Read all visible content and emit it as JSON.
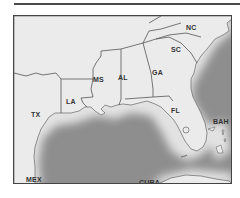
{
  "map": {
    "region": "Southeastern United States and Gulf of Mexico",
    "labels": [
      {
        "id": "nc",
        "text": "NC",
        "x": 185,
        "y": 23
      },
      {
        "id": "sc",
        "text": "SC",
        "x": 170,
        "y": 45
      },
      {
        "id": "ga",
        "text": "GA",
        "x": 151,
        "y": 68
      },
      {
        "id": "al",
        "text": "AL",
        "x": 117,
        "y": 73
      },
      {
        "id": "ms",
        "text": "MS",
        "x": 92,
        "y": 75
      },
      {
        "id": "la",
        "text": "LA",
        "x": 65,
        "y": 97
      },
      {
        "id": "tx",
        "text": "TX",
        "x": 30,
        "y": 110
      },
      {
        "id": "fl",
        "text": "FL",
        "x": 170,
        "y": 106
      },
      {
        "id": "bah",
        "text": "BAH",
        "x": 212,
        "y": 117
      },
      {
        "id": "mex",
        "text": "MEX",
        "x": 25,
        "y": 175
      },
      {
        "id": "cuba",
        "text": "CUBA",
        "x": 138,
        "y": 178
      }
    ],
    "colors": {
      "land": "#ebebeb",
      "water": "#8e8e8e",
      "border": "#555555",
      "frame": "#444444"
    }
  }
}
